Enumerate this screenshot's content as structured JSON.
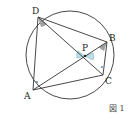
{
  "diagram": {
    "type": "inscribed-quadrilateral-with-diagonals",
    "figure_label": "図 1",
    "points": {
      "A": {
        "label": "A"
      },
      "B": {
        "label": "B"
      },
      "C": {
        "label": "C"
      },
      "D": {
        "label": "D"
      },
      "P": {
        "label": "P"
      }
    },
    "segments": [
      "AD",
      "DB",
      "BC",
      "CA",
      "AB",
      "DC"
    ],
    "angle_marks": {
      "gray_wedges": [
        "ADC at D",
        "ABC at B"
      ],
      "blue_wedges": [
        "APD / BPC vertical angles at P"
      ],
      "dot_marks": [
        "DAB at A",
        "DCB at C"
      ]
    },
    "colors": {
      "line": "#333333",
      "gray_angle": "#a0a0a0",
      "blue_angle": "#bfe0ea",
      "dot": "#4a7fb0"
    }
  }
}
